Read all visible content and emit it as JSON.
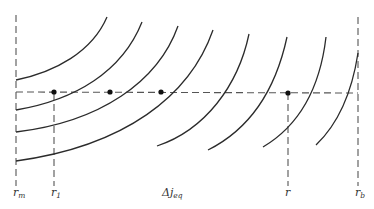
{
  "diagram": {
    "labels": {
      "r_m": {
        "base": "r",
        "sub": "m"
      },
      "r_1": {
        "base": "r",
        "sub": "1"
      },
      "delta_j": {
        "base": "Δj",
        "sub": "eq"
      },
      "r": {
        "base": "r",
        "sub": ""
      },
      "r_b": {
        "base": "r",
        "sub": "b"
      }
    },
    "arc_count": 8,
    "marked_point_count": 4,
    "colors": {
      "curve": "#2b2b2b",
      "dashed": "#555555",
      "point": "#111111",
      "text": "#333333",
      "background": "#ffffff"
    }
  }
}
